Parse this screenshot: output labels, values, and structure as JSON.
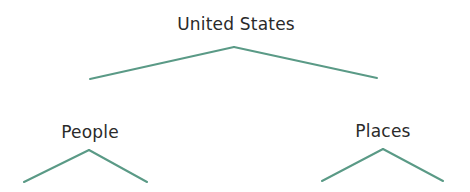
{
  "diagram": {
    "type": "tree",
    "line_color": "#5a9a86",
    "text_color": "#2a2a2a",
    "nodes": [
      {
        "id": "root",
        "label": "United States",
        "x": 236,
        "y": 14
      },
      {
        "id": "people",
        "label": "People",
        "x": 90,
        "y": 122
      },
      {
        "id": "places",
        "label": "Places",
        "x": 383,
        "y": 121
      }
    ],
    "edges": [
      {
        "from": "root",
        "x1": 234,
        "y1": 47,
        "x2": 90,
        "y2": 79
      },
      {
        "from": "root",
        "x1": 234,
        "y1": 47,
        "x2": 377,
        "y2": 78
      },
      {
        "from": "people",
        "x1": 89,
        "y1": 150,
        "x2": 24,
        "y2": 182
      },
      {
        "from": "people",
        "x1": 89,
        "y1": 150,
        "x2": 147,
        "y2": 182
      },
      {
        "from": "places",
        "x1": 383,
        "y1": 149,
        "x2": 322,
        "y2": 181
      },
      {
        "from": "places",
        "x1": 383,
        "y1": 149,
        "x2": 443,
        "y2": 181
      }
    ]
  }
}
